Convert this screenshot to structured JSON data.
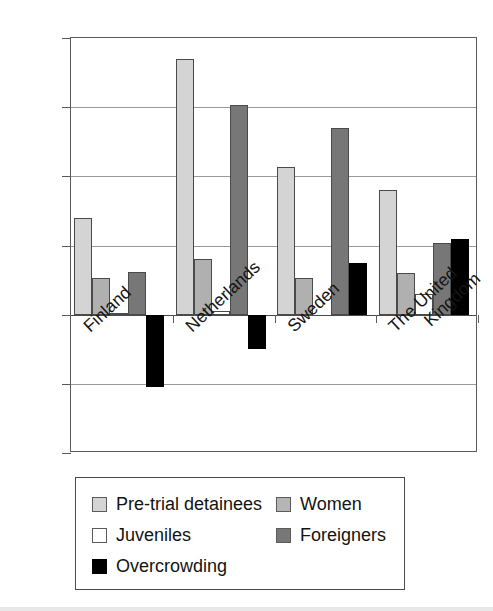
{
  "chart_data": {
    "type": "bar",
    "title": "",
    "xlabel": "",
    "ylabel": "",
    "ylim": [
      -20,
      40
    ],
    "yticks": [
      40,
      30,
      20,
      10,
      0,
      -10,
      -20
    ],
    "ytick_labels": [
      "40",
      "30",
      "20",
      "10",
      "0",
      "−10",
      "−20"
    ],
    "grid": true,
    "legend_position": "bottom",
    "categories": [
      "Finland",
      "Netherlands",
      "Sweden",
      "The United Kingdom"
    ],
    "category_label_lines": [
      [
        "Finland"
      ],
      [
        "Netherlands"
      ],
      [
        "Sweden"
      ],
      [
        "The United",
        "Kingdom"
      ]
    ],
    "series": [
      {
        "name": "Pre-trial detainees",
        "key": "pretrial",
        "color": "#d4d4d4",
        "values": [
          14.0,
          37.0,
          21.3,
          18.0
        ]
      },
      {
        "name": "Women",
        "key": "women",
        "color": "#b0b0b0",
        "values": [
          5.3,
          8.0,
          5.3,
          6.0
        ]
      },
      {
        "name": "Juveniles",
        "key": "juveniles",
        "color": "#ffffff",
        "values": [
          0.3,
          0.6,
          0.0,
          3.0
        ]
      },
      {
        "name": "Foreigners",
        "key": "foreigners",
        "color": "#777777",
        "values": [
          6.2,
          30.3,
          27.0,
          10.3
        ]
      },
      {
        "name": "Overcrowding",
        "key": "overcrowding",
        "color": "#000000",
        "values": [
          -10.5,
          -5.0,
          7.4,
          11.0
        ]
      }
    ]
  },
  "legend": {
    "columns": [
      [
        {
          "label": "Pre-trial detainees",
          "key": "pretrial"
        },
        {
          "label": "Juveniles",
          "key": "juveniles"
        },
        {
          "label": "Overcrowding",
          "key": "overcrowding"
        }
      ],
      [
        {
          "label": "Women",
          "key": "women"
        },
        {
          "label": "Foreigners",
          "key": "foreigners"
        }
      ]
    ]
  }
}
